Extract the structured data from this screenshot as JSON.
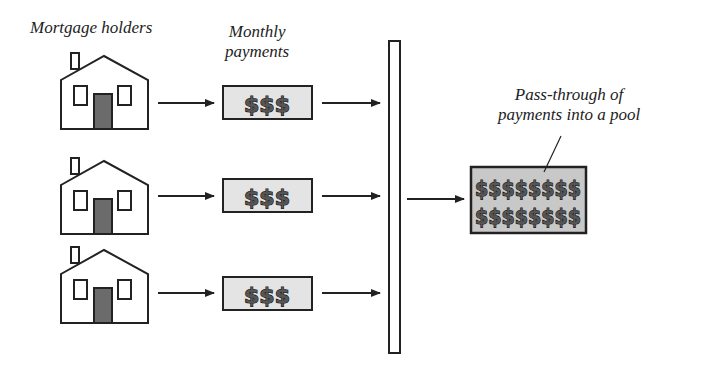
{
  "labels": {
    "mortgage_holders": "Mortgage holders",
    "monthly_payments_line1": "Monthly",
    "monthly_payments_line2": "payments",
    "pool_line1": "Pass-through of",
    "pool_line2": "payments into a pool"
  },
  "payments": [
    {
      "symbol": "$$$"
    },
    {
      "symbol": "$$$"
    },
    {
      "symbol": "$$$"
    }
  ],
  "pool": {
    "row1": "$$$$$$$$",
    "row2": "$$$$$$$$"
  },
  "colors": {
    "door": "#6b6b6b",
    "payment_box": "#e4e4e4",
    "pool_box": "#c8c8c8",
    "stroke": "#222222"
  }
}
